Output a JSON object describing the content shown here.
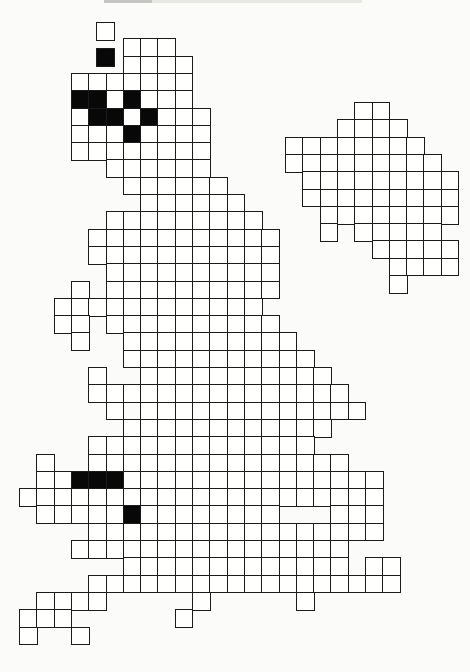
{
  "page": {
    "background": "#fbfbf9",
    "cropped_caption": {
      "present": true,
      "note_visible_pixels": "faint bottom edge of cut-off text line",
      "x": 104,
      "width": 258,
      "height": 3,
      "dark_segment_width": 48,
      "color_dark": "#9a9a98",
      "color_light": "#d8d8d4"
    }
  },
  "map": {
    "kind": "grid-distribution-atlas-map",
    "depicted_region": "Great Britain mainland with offshore island grids",
    "cell_size": 17.3,
    "line_color": "#1b1b1b",
    "line_width": 1.5,
    "empty_cell_color": "#fffffe",
    "filled_cell_color": "#080808",
    "mainland": {
      "origin_x": 19,
      "origin_y": 21,
      "rows": [
        {
          "r": 1,
          "cols": "6-8"
        },
        {
          "r": 2,
          "cols": "6-9"
        },
        {
          "r": 3,
          "cols": "3-9"
        },
        {
          "r": 4,
          "cols": "3-9"
        },
        {
          "r": 5,
          "cols": "3-10"
        },
        {
          "r": 6,
          "cols": "3-10"
        },
        {
          "r": 7,
          "cols": "3-10"
        },
        {
          "r": 8,
          "cols": "5-10"
        },
        {
          "r": 9,
          "cols": "6-11"
        },
        {
          "r": 10,
          "cols": "7-12"
        },
        {
          "r": 11,
          "cols": "5-13"
        },
        {
          "r": 12,
          "cols": "4-14"
        },
        {
          "r": 13,
          "cols": "4-14"
        },
        {
          "r": 14,
          "cols": "5-14"
        },
        {
          "r": 15,
          "cols": "3,5-14"
        },
        {
          "r": 16,
          "cols": "2-13"
        },
        {
          "r": 17,
          "cols": "2-3,5-14"
        },
        {
          "r": 18,
          "cols": "3,6-15"
        },
        {
          "r": 19,
          "cols": "6-16"
        },
        {
          "r": 20,
          "cols": "4,7-17"
        },
        {
          "r": 21,
          "cols": "4-18"
        },
        {
          "r": 22,
          "cols": "5,7-19"
        },
        {
          "r": 23,
          "cols": "6-17"
        },
        {
          "r": 24,
          "cols": "4-16"
        },
        {
          "r": 25,
          "cols": "1,4-18"
        },
        {
          "r": 26,
          "cols": "1-20"
        },
        {
          "r": 27,
          "cols": "0-20"
        },
        {
          "r": 28,
          "cols": "1-14,18-20"
        },
        {
          "r": 29,
          "cols": "4-20"
        },
        {
          "r": 30,
          "cols": "3-18"
        },
        {
          "r": 31,
          "cols": "6-18,20-21"
        },
        {
          "r": 32,
          "cols": "4-21"
        },
        {
          "r": 33,
          "cols": "1-4,10,16"
        },
        {
          "r": 34,
          "cols": "0-2,9"
        },
        {
          "r": 35,
          "cols": "0,3"
        }
      ],
      "black_cells": [
        [
          4,
          3
        ],
        [
          4,
          4
        ],
        [
          4,
          6
        ],
        [
          5,
          4
        ],
        [
          5,
          5
        ],
        [
          5,
          7
        ],
        [
          6,
          6
        ],
        [
          26,
          3
        ],
        [
          26,
          4
        ],
        [
          26,
          5
        ],
        [
          28,
          6
        ]
      ]
    },
    "offset_island_cells": [
      {
        "x": 96,
        "y": 22,
        "filled": false
      },
      {
        "x": 96,
        "y": 48,
        "filled": true
      }
    ],
    "inset_island_grid": {
      "origin_x": 285,
      "origin_y": 102,
      "rows": [
        {
          "r": 0,
          "cols": "4-5"
        },
        {
          "r": 1,
          "cols": "3-6"
        },
        {
          "r": 2,
          "cols": "0-7"
        },
        {
          "r": 3,
          "cols": "0-8"
        },
        {
          "r": 4,
          "cols": "1-9"
        },
        {
          "r": 5,
          "cols": "1-9"
        },
        {
          "r": 6,
          "cols": "2-9"
        },
        {
          "r": 7,
          "cols": "2,4-8"
        },
        {
          "r": 8,
          "cols": "5-9"
        },
        {
          "r": 9,
          "cols": "6-9"
        },
        {
          "r": 10,
          "cols": "6"
        }
      ],
      "black_cells": []
    }
  }
}
